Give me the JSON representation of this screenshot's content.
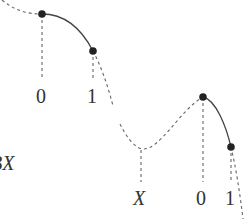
{
  "diagram": {
    "left_label": "BX",
    "first_curve": {
      "points": [
        {
          "name": "point-0",
          "x": 42,
          "y": 14
        },
        {
          "name": "point-1",
          "x": 93,
          "y": 51
        }
      ],
      "labels": [
        "0",
        "1"
      ]
    },
    "second_curve": {
      "points": [
        {
          "name": "point-0",
          "x": 203,
          "y": 97
        },
        {
          "name": "point-1",
          "x": 231,
          "y": 147
        }
      ],
      "labels": [
        "X",
        "0",
        "1"
      ]
    },
    "colors": {
      "line": "#444444",
      "dashed": "#666666",
      "dot": "#222222",
      "text": "#333333"
    }
  }
}
